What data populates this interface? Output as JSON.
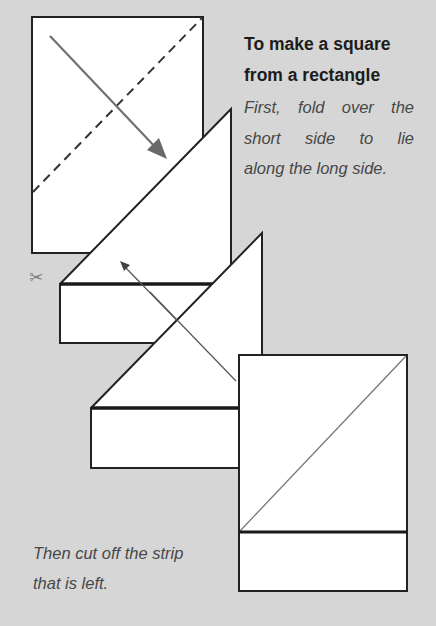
{
  "heading": {
    "line1": "To make a square",
    "line2": "from a rectangle"
  },
  "step1": {
    "line1": "First, fold over the",
    "line2": "short side to lie",
    "line3": "along the long side."
  },
  "step2": {
    "line1": "Then cut off the strip",
    "line2": "that is left."
  },
  "icons": {
    "scissors": "✂"
  },
  "colors": {
    "background": "#d6d6d6",
    "paper": "#ffffff",
    "outline": "#222222",
    "arrow": "#6e6e6e",
    "text_heading": "#1c1c1c",
    "text_body": "#474747"
  }
}
